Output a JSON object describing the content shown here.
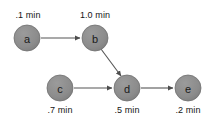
{
  "diagram": {
    "type": "task-dependency-graph",
    "background_color": "#ffffff",
    "node_fill_color": "#8c8c8c",
    "node_stroke_color": "#6e6e6e",
    "edge_color": "#555555",
    "text_color": "#141414",
    "nodes": [
      {
        "id": "a",
        "label": "a",
        "time_label": ".1 min",
        "cx": 27,
        "cy": 38,
        "r": 13,
        "label_position": "above"
      },
      {
        "id": "b",
        "label": "b",
        "time_label": "1.0 min",
        "cx": 95,
        "cy": 38,
        "r": 13,
        "label_position": "above"
      },
      {
        "id": "c",
        "label": "c",
        "time_label": ".7 min",
        "cx": 60,
        "cy": 88,
        "r": 13,
        "label_position": "below"
      },
      {
        "id": "d",
        "label": "d",
        "time_label": ".5 min",
        "cx": 127,
        "cy": 88,
        "r": 13,
        "label_position": "below"
      },
      {
        "id": "e",
        "label": "e",
        "time_label": ".2 min",
        "cx": 188,
        "cy": 88,
        "r": 13,
        "label_position": "below"
      }
    ],
    "edges": [
      {
        "from": "a",
        "to": "b",
        "x1": 41,
        "y1": 38,
        "x2": 80,
        "y2": 38
      },
      {
        "from": "b",
        "to": "d",
        "x1": 101,
        "y1": 49,
        "x2": 121,
        "y2": 76
      },
      {
        "from": "c",
        "to": "d",
        "x1": 74,
        "y1": 88,
        "x2": 112,
        "y2": 88
      },
      {
        "from": "d",
        "to": "e",
        "x1": 141,
        "y1": 88,
        "x2": 173,
        "y2": 88
      }
    ],
    "time_label_positions": [
      {
        "id": "a",
        "x": 28,
        "y": 15
      },
      {
        "id": "b",
        "x": 95,
        "y": 15
      },
      {
        "id": "c",
        "x": 60,
        "y": 110
      },
      {
        "id": "d",
        "x": 127,
        "y": 110
      },
      {
        "id": "e",
        "x": 188,
        "y": 110
      }
    ]
  }
}
